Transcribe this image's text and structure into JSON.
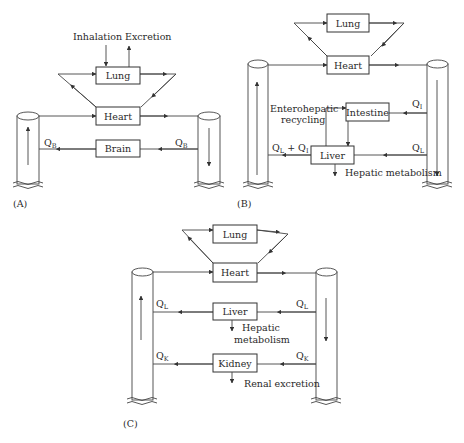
{
  "panels": {
    "A": {
      "label": "(A)",
      "inhalation": "Inhalation",
      "excretion": "Excretion",
      "lung": "Lung",
      "heart": "Heart",
      "brain": "Brain",
      "flow_left": "Q",
      "flow_left_sub": "B",
      "flow_right": "Q",
      "flow_right_sub": "B"
    },
    "B": {
      "label": "(B)",
      "lung": "Lung",
      "heart": "Heart",
      "intestine": "Intestine",
      "liver": "Liver",
      "enterohepatic_1": "Enterohepatic",
      "enterohepatic_2": "recycling",
      "hepatic_metabolism": "Hepatic metabolism",
      "flow_intestine": "Q",
      "flow_intestine_sub": "I",
      "flow_liver": "Q",
      "flow_liver_sub": "L",
      "flow_out_q1": "Q",
      "flow_out_q1_sub": "L",
      "flow_out_plus": " + Q",
      "flow_out_q2_sub": "I"
    },
    "C": {
      "label": "(C)",
      "lung": "Lung",
      "heart": "Heart",
      "liver": "Liver",
      "kidney": "Kidney",
      "hepatic_1": "Hepatic",
      "hepatic_2": "metabolism",
      "renal": "Renal excretion",
      "flow_liver_left": "Q",
      "flow_liver_left_sub": "L",
      "flow_liver_right": "Q",
      "flow_liver_right_sub": "L",
      "flow_kidney_left": "Q",
      "flow_kidney_left_sub": "K",
      "flow_kidney_right": "Q",
      "flow_kidney_right_sub": "K"
    }
  }
}
